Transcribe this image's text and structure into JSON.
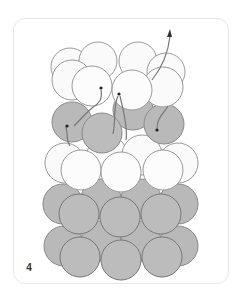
{
  "figure": {
    "step_label": "4",
    "colors": {
      "light_bead_fill": "#fafafa",
      "dark_bead_fill": "#b9b9b9",
      "bead_stroke": "#8a8a8a",
      "thread": "#777777",
      "card_border": "#e6e6e6"
    }
  }
}
